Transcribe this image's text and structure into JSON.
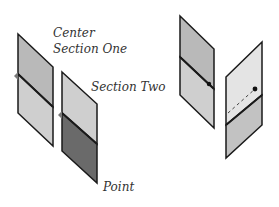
{
  "diagram": {
    "labels": {
      "center": "Center",
      "section_one": "Section One",
      "section_two": "Section Two",
      "point": "Point"
    },
    "colors": {
      "outline": "#1a1a1a",
      "panel_upper_mid": "#b9b9b9",
      "panel_lower_light": "#cfcfcf",
      "panel_dark": "#6a6a6a",
      "panel_lightest": "#e4e4e4",
      "dot": "#111111"
    }
  }
}
